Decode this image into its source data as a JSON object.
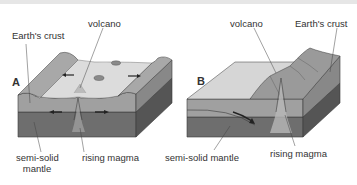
{
  "figure": {
    "panels": [
      {
        "id": "A",
        "letter": "A",
        "labels": {
          "volcano": "volcano",
          "crust": "Earth's crust",
          "mantle_line1": "semi-solid",
          "mantle_line2": "mantle",
          "magma": "rising magma"
        }
      },
      {
        "id": "B",
        "letter": "B",
        "labels": {
          "volcano": "volcano",
          "crust": "Earth's crust",
          "mantle": "semi-solid mantle",
          "magma": "rising magma"
        }
      }
    ],
    "colors": {
      "crust_top_light": "#dcdcdc",
      "crust_surface": "#b3b3b3",
      "crust_side": "#9a9a9a",
      "mantle_side": "#6e6e6e",
      "mantle_dark": "#5a5a5a",
      "outline": "#3a3a3a",
      "label_text": "#333333"
    }
  }
}
